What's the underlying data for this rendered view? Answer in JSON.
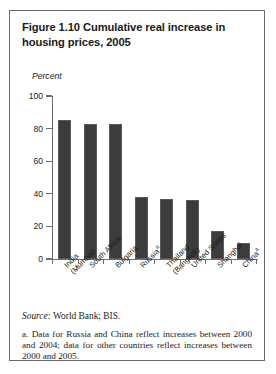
{
  "figure": {
    "title": "Figure 1.10  Cumulative real increase in housing prices, 2005",
    "unit_label": "Percent"
  },
  "notes": {
    "source_label": "Source:",
    "source_text": " World Bank; BIS.",
    "footnote_a": "a. Data for Russia and China reflect increases between 2000 and 2004; data for other countries reflect increases between 2000 and 2005."
  },
  "colors": {
    "bar_fill": "#3c3c3c",
    "axis": "#6f6f6f",
    "border": "#6b6b6b",
    "text": "#1a1a1a"
  },
  "chart_data": {
    "type": "bar",
    "title": "Figure 1.10  Cumulative real increase in housing prices, 2005",
    "xlabel": "",
    "ylabel": "Percent",
    "ylim": [
      0,
      100
    ],
    "yticks": [
      0,
      20,
      40,
      60,
      80,
      100
    ],
    "grid": false,
    "legend": "none",
    "categories": [
      "India (Mumbai)",
      "South Africa",
      "Bulgaria",
      "Russia",
      "Thailand (Bangkok)",
      "United States",
      "Shanghai",
      "China"
    ],
    "category_lines": [
      [
        "India",
        "(Mumbai)"
      ],
      [
        "South Africa"
      ],
      [
        "Bulgaria"
      ],
      [
        "Russia"
      ],
      [
        "Thailand",
        "(Bangkok)"
      ],
      [
        "United States"
      ],
      [
        "Shanghai"
      ],
      [
        "China"
      ]
    ],
    "category_footnote_markers": [
      "",
      "",
      "",
      "a",
      "",
      "",
      "",
      "a"
    ],
    "values": [
      85,
      83,
      83,
      38,
      37,
      36,
      17,
      10
    ]
  }
}
